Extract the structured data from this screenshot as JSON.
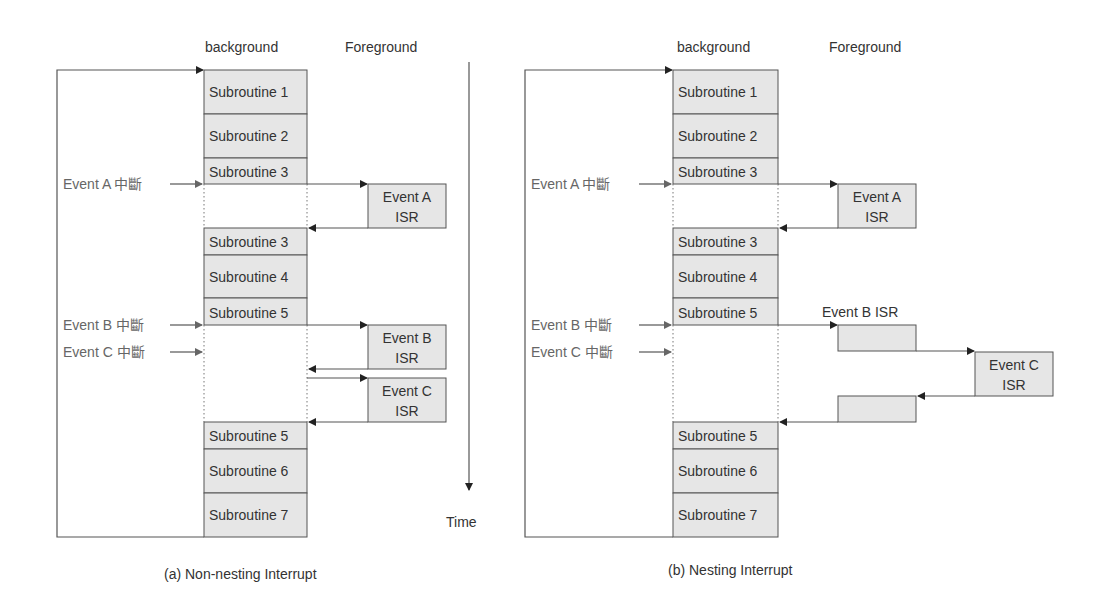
{
  "diagrams": [
    {
      "caption": "(a) Non-nesting Interrupt",
      "header_background": "background",
      "header_foreground": "Foreground",
      "time_label": "Time",
      "subroutines": [
        "Subroutine 1",
        "Subroutine 2",
        "Subroutine 3",
        "Subroutine 3",
        "Subroutine 4",
        "Subroutine 5",
        "Subroutine 5",
        "Subroutine 6",
        "Subroutine 7"
      ],
      "events": [
        "Event A 中斷",
        "Event B 中斷",
        "Event C 中斷"
      ],
      "isr": [
        {
          "line1": "Event A",
          "line2": "ISR"
        },
        {
          "line1": "Event B",
          "line2": "ISR"
        },
        {
          "line1": "Event C",
          "line2": "ISR"
        }
      ]
    },
    {
      "caption": "(b) Nesting Interrupt",
      "header_background": "background",
      "header_foreground": "Foreground",
      "subroutines": [
        "Subroutine 1",
        "Subroutine 2",
        "Subroutine 3",
        "Subroutine 3",
        "Subroutine 4",
        "Subroutine 5",
        "Subroutine 5",
        "Subroutine 6",
        "Subroutine 7"
      ],
      "events": [
        "Event A 中斷",
        "Event B 中斷",
        "Event C 中斷"
      ],
      "isr": [
        {
          "line1": "Event A",
          "line2": "ISR"
        },
        {
          "line1": "Event B ISR"
        },
        {
          "line1": "Event C",
          "line2": "ISR"
        }
      ]
    }
  ]
}
